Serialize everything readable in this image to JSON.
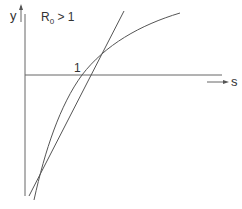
{
  "diagram": {
    "title_main": "R",
    "title_sub": "0",
    "title_rest": " > 1",
    "y_axis_label": "y",
    "x_axis_label": "s",
    "intersection_label": "1",
    "curves": [
      "straight line",
      "concave curve"
    ],
    "colors": {
      "line": "#555555",
      "axis": "#666666"
    }
  }
}
